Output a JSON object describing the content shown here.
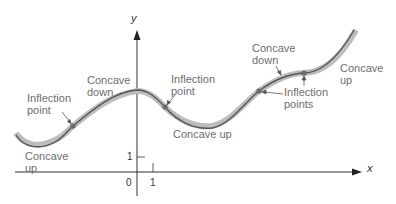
{
  "figure": {
    "axes": {
      "x_label": "x",
      "y_label": "y",
      "origin_label": "0",
      "x_tick_label": "1",
      "y_tick_label": "1"
    },
    "annotations": {
      "inflection_point_left": "Inflection\npoint",
      "concave_down_left": "Concave\ndown",
      "inflection_point_middle": "Inflection\npoint",
      "concave_up_left": "Concave\nup",
      "concave_up_middle": "Concave up",
      "concave_down_right": "Concave\ndown",
      "inflection_points_right": "Inflection\npoints",
      "concave_up_right": "Concave\nup"
    },
    "colors": {
      "curve_stroke": "#555555",
      "curve_band": "#b8b8b8",
      "axis": "#333333",
      "label_text": "#6e6e6e",
      "point_fill": "#6a6a6a"
    },
    "inflection_points": [
      {
        "x": 73,
        "y": 126
      },
      {
        "x": 165,
        "y": 107
      },
      {
        "x": 259,
        "y": 91
      },
      {
        "x": 304,
        "y": 73
      }
    ]
  }
}
